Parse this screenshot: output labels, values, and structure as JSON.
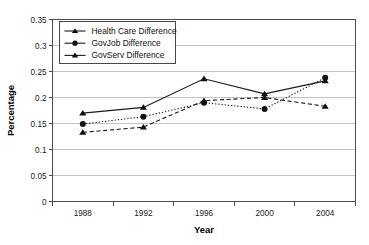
{
  "chart_data": {
    "type": "line",
    "title": "",
    "xlabel": "Year",
    "ylabel": "Percentage",
    "categories": [
      "1988",
      "1992",
      "1996",
      "2000",
      "2004"
    ],
    "ylim": [
      0,
      0.35
    ],
    "yticks": [
      0,
      0.05,
      0.1,
      0.15,
      0.2,
      0.25,
      0.3,
      0.35
    ],
    "ytick_labels": [
      "0",
      "0.05",
      "0.1",
      "0.15",
      "0.2",
      "0.25",
      "0.3",
      "0.35"
    ],
    "grid": "horizontal",
    "legend_position": "top-left-inside",
    "series": [
      {
        "name": "Health Care Difference",
        "values": [
          0.17,
          0.181,
          0.236,
          0.207,
          0.232
        ],
        "line_style": "solid",
        "marker": "triangle",
        "color": "#1a1a1a"
      },
      {
        "name": "GovJob Difference",
        "values": [
          0.149,
          0.163,
          0.19,
          0.178,
          0.238
        ],
        "line_style": "dotted",
        "marker": "circle",
        "color": "#1a1a1a"
      },
      {
        "name": "GovServ Difference",
        "values": [
          0.133,
          0.143,
          0.194,
          0.2,
          0.183
        ],
        "line_style": "dashed",
        "marker": "triangle",
        "color": "#1a1a1a"
      }
    ]
  },
  "legend": {
    "items": [
      {
        "label": "Health Care Difference"
      },
      {
        "label": "GovJob Difference"
      },
      {
        "label": "GovServ Difference"
      }
    ]
  },
  "axes": {
    "x_title": "Year",
    "y_title": "Percentage"
  }
}
